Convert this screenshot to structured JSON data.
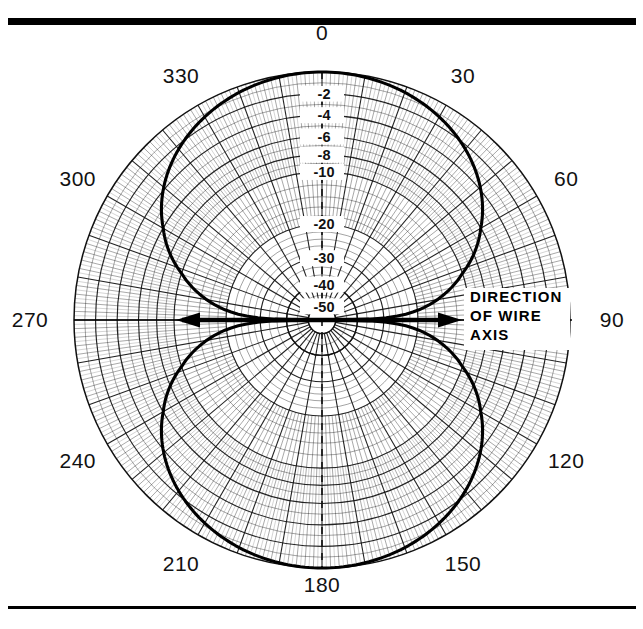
{
  "figure": {
    "background_color": "#ffffff",
    "ink_color": "#111111",
    "rule_color": "#000000",
    "top_rule": {
      "y": 18,
      "thickness": 7,
      "x0": 8,
      "x1": 636
    },
    "bottom_rule": {
      "y": 606,
      "thickness": 3,
      "x0": 8,
      "x1": 636
    }
  },
  "annotation": {
    "wire_axis_lines": [
      "DIRECTION",
      "OF WIRE",
      "AXIS"
    ],
    "arrow_label": "direction-of-wire-axis"
  },
  "chart_data": {
    "type": "line",
    "subtype": "polar",
    "title": "",
    "xlabel": "",
    "ylabel": "",
    "grid": true,
    "legend_position": "none",
    "center": {
      "x": 322,
      "y": 320
    },
    "outer_radius": 248,
    "angle_labels": [
      "0",
      "30",
      "60",
      "90",
      "120",
      "150",
      "180",
      "210",
      "240",
      "270",
      "300",
      "330"
    ],
    "angle_label_values": [
      0,
      30,
      60,
      90,
      120,
      150,
      180,
      210,
      240,
      270,
      300,
      330
    ],
    "angle_tick_step_deg": 2,
    "angle_major_step_deg": 10,
    "radial_unit": "dB",
    "radial_labels": [
      "-2",
      "-4",
      "-6",
      "-8",
      "-10",
      "-20",
      "-30",
      "-40",
      "-50"
    ],
    "radial_label_values": [
      -2,
      -4,
      -6,
      -8,
      -10,
      -20,
      -30,
      -40,
      -50
    ],
    "rlim": [
      -50,
      0
    ],
    "ring_values": [
      -1,
      -2,
      -3,
      -4,
      -5,
      -6,
      -7,
      -8,
      -9,
      -10,
      -12,
      -14,
      -16,
      -18,
      -20,
      -22,
      -24,
      -26,
      -28,
      -30,
      -33,
      -36,
      -40,
      -45,
      -50
    ],
    "series": [
      {
        "name": "wire antenna pattern",
        "description": "figure-eight dipole power pattern, maxima at 0 and 180 degrees, nulls at 90 and 270 degrees",
        "theta": [
          0,
          10,
          20,
          30,
          40,
          50,
          60,
          70,
          80,
          85,
          88,
          90,
          92,
          95,
          100,
          110,
          120,
          130,
          140,
          150,
          160,
          170,
          180,
          190,
          200,
          210,
          220,
          230,
          240,
          250,
          260,
          265,
          268,
          270,
          272,
          275,
          280,
          290,
          300,
          310,
          320,
          330,
          340,
          350,
          360
        ],
        "values_db": [
          0,
          -0.13,
          -0.54,
          -1.25,
          -2.31,
          -3.82,
          -6.02,
          -9.32,
          -15.18,
          -21.2,
          -29.1,
          -50,
          -29.1,
          -21.2,
          -15.18,
          -9.32,
          -6.02,
          -3.82,
          -2.31,
          -1.25,
          -0.54,
          -0.13,
          0,
          -0.13,
          -0.54,
          -1.25,
          -2.31,
          -3.82,
          -6.02,
          -9.32,
          -15.18,
          -21.2,
          -29.1,
          -50,
          -29.1,
          -21.2,
          -15.18,
          -9.32,
          -6.02,
          -3.82,
          -2.31,
          -1.25,
          -0.54,
          -0.13,
          0
        ]
      }
    ]
  }
}
